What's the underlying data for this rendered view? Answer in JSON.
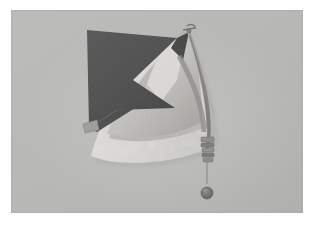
{
  "image": {
    "kind": "photograph",
    "subject": "kite-like sculpture with dark triangular sail, light fan membrane, curved spar and hanging pendulum ball",
    "orientation": "landscape",
    "frame": {
      "canvas_width": 321,
      "canvas_height": 228,
      "border_color": "#ffffff",
      "border_left": 11,
      "border_top": 10,
      "plate_width": 292,
      "plate_height": 203
    },
    "background": {
      "color": "#b9b9b7",
      "label": "neutral grey studio backdrop",
      "vignette_color": "#aeaeac"
    },
    "elements": [
      {
        "id": "dark-sail",
        "label": "dark triangular sail",
        "color": "#4b4b4b",
        "shadow_color": "#3a3a3a"
      },
      {
        "id": "light-fan",
        "label": "light fan membrane",
        "color": "#d4d3cf",
        "highlight_color": "#e2e1dd"
      },
      {
        "id": "mid-panel",
        "label": "mid grey panel",
        "color": "#b2b1ad"
      },
      {
        "id": "curved-spar",
        "label": "curved spar leading edge",
        "color": "#8e8d89"
      },
      {
        "id": "banded-collar",
        "label": "banded collar fitting",
        "color": "#7e7d79"
      },
      {
        "id": "apex-fitting",
        "label": "apex hook fitting",
        "color": "#7a7975"
      },
      {
        "id": "corner-tab",
        "label": "lower left corner tab",
        "color": "#9c9b97"
      },
      {
        "id": "plumb-line",
        "label": "plumb line string",
        "color": "#8a8985"
      },
      {
        "id": "plumb-ball",
        "label": "pendulum ball weight",
        "color": "#6e6d69",
        "center_x": 206,
        "center_y": 190,
        "radius": 6
      }
    ],
    "palette": {
      "darkest": "#3a3a3a",
      "dark": "#4b4b4b",
      "mid": "#8e8d89",
      "light": "#d4d3cf",
      "lightest": "#e6e5e1",
      "backdrop": "#b9b9b7",
      "paper": "#ffffff"
    }
  }
}
